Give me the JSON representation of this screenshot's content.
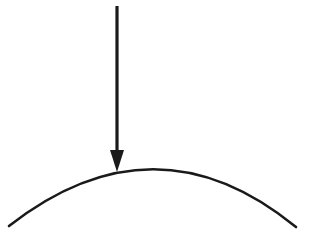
{
  "diagram": {
    "colors": {
      "background": "#ffffff",
      "stroke": "#1a1a1a"
    },
    "arrow": {
      "direction": "down",
      "x": 117,
      "y_start": 6,
      "y_tip": 172,
      "icon": "arrow-down-icon"
    },
    "arc": {
      "shape": "convex-arc",
      "start": [
        9,
        226
      ],
      "peak": [
        155,
        170
      ],
      "end": [
        296,
        227
      ]
    }
  }
}
